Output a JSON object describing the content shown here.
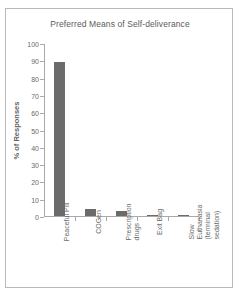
{
  "chart_data": {
    "type": "bar",
    "title": "Preferred Means of Self-deliverance",
    "xlabel": "",
    "ylabel": "% of Responses",
    "categories": [
      "Peaceful Pill",
      "COGen",
      "Prescription drugs",
      "Exit Bag",
      "Slow Euthanasia (terminal sedation)"
    ],
    "category_lines": [
      [
        "Peaceful Pill"
      ],
      [
        "COGen"
      ],
      [
        "Prescription",
        "drugs"
      ],
      [
        "Exit Bag"
      ],
      [
        "Slow",
        "Euthanasia",
        "(terminal",
        "sedation)"
      ]
    ],
    "values": [
      89,
      4,
      3,
      0.4,
      0.4
    ],
    "ylim": [
      0,
      100
    ],
    "yticks": [
      0,
      10,
      20,
      30,
      40,
      50,
      60,
      70,
      80,
      90,
      100
    ],
    "ytick_labels": [
      "0",
      "10",
      "20",
      "30",
      "40",
      "50",
      "60",
      "70",
      "80",
      "90",
      "100"
    ],
    "grid": false,
    "legend": false,
    "bar_color": "#6b6b6b",
    "axis_color": "#aaaaaa",
    "text_color": "#6a6a6a",
    "frame_border_color": "#b9b9b9",
    "background": "#ffffff"
  }
}
